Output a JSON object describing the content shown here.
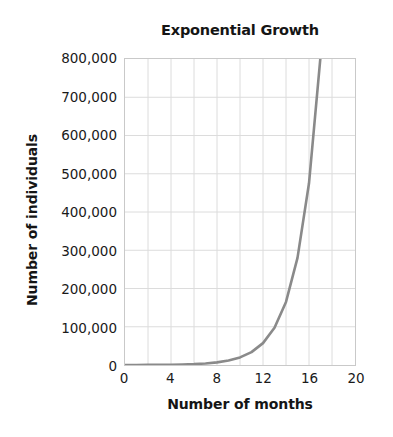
{
  "chart_data": {
    "type": "line",
    "title": "Exponential Growth",
    "xlabel": "Number of months",
    "ylabel": "Number of individuals",
    "xlim": [
      0,
      20
    ],
    "ylim": [
      0,
      800000
    ],
    "grid": true,
    "legend": "none",
    "x_ticks": [
      "0",
      "4",
      "8",
      "12",
      "16",
      "20"
    ],
    "x_tick_values": [
      0,
      4,
      8,
      12,
      16,
      20
    ],
    "x_gridline_step": 2,
    "y_ticks": [
      "0",
      "100,000",
      "200,000",
      "300,000",
      "400,000",
      "500,000",
      "600,000",
      "700,000",
      "800,000"
    ],
    "y_tick_values": [
      0,
      100000,
      200000,
      300000,
      400000,
      500000,
      600000,
      700000,
      800000
    ],
    "series": [
      {
        "name": "Population",
        "color": "#8a8a8a",
        "x": [
          0,
          1,
          2,
          3,
          4,
          5,
          6,
          7,
          8,
          9,
          10,
          11,
          12,
          13,
          14,
          15,
          16,
          17,
          17.2
        ],
        "values": [
          100,
          170,
          288,
          489,
          830,
          1409,
          2392,
          4061,
          6894,
          11702,
          19866,
          33724,
          57244,
          97175,
          164950,
          280000,
          475000,
          806000,
          860000
        ]
      }
    ],
    "annotations": [
      "Curve stays near zero until about month 8",
      "Crosses 100,000 at about month 12.5",
      "Exits top of plot at 800,000 near month 17"
    ]
  },
  "colors": {
    "curve": "#8a8a8a",
    "grid": "#dcdcdc",
    "frame": "#c9c9c9",
    "text": "#151515",
    "background": "#ffffff"
  }
}
